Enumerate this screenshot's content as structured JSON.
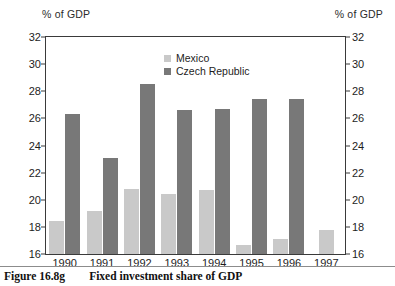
{
  "figure": {
    "unit_label_left": "% of GDP",
    "unit_label_right": "% of GDP",
    "caption_number": "Figure 16.8g",
    "caption_text": "Fixed investment share of GDP"
  },
  "legend": {
    "items": [
      {
        "label": "Mexico",
        "color": "#c9c9c9"
      },
      {
        "label": "Czech Republic",
        "color": "#787878"
      }
    ]
  },
  "axes": {
    "y_ticks": [
      "16",
      "18",
      "20",
      "22",
      "24",
      "26",
      "28",
      "30",
      "32"
    ],
    "x_ticks": [
      "1990",
      "1991",
      "1992",
      "1993",
      "1994",
      "1995",
      "1996",
      "1997"
    ]
  },
  "chart_data": {
    "type": "bar",
    "title": "Fixed investment share of GDP",
    "xlabel": "",
    "ylabel": "% of GDP",
    "ylim": [
      16,
      32
    ],
    "ytick_step": 2,
    "grid": false,
    "legend_position": "top-center",
    "categories": [
      "1990",
      "1991",
      "1992",
      "1993",
      "1994",
      "1995",
      "1996",
      "1997"
    ],
    "series": [
      {
        "name": "Mexico",
        "color": "#c9c9c9",
        "values": [
          18.4,
          19.2,
          20.8,
          20.4,
          20.7,
          16.7,
          17.1,
          17.8
        ]
      },
      {
        "name": "Czech Republic",
        "color": "#787878",
        "values": [
          26.3,
          23.1,
          28.5,
          26.6,
          26.7,
          27.4,
          27.4,
          null
        ]
      }
    ]
  }
}
